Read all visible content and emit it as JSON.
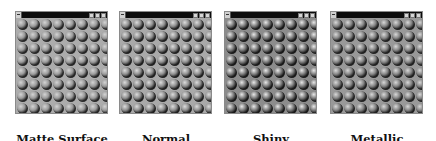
{
  "windows": [
    {
      "id": "matte",
      "label": "Matte Surface",
      "bg": "#acacac",
      "sphere_light": "#d4d4d4",
      "sphere_mid": "#9a9a9a",
      "sphere_shadow": "#1a1a1a",
      "left": 15
    },
    {
      "id": "normal",
      "label": "Normal",
      "bg": "#a9a9a9",
      "sphere_light": "#dcdcdc",
      "sphere_mid": "#8e8e8e",
      "sphere_shadow": "#141414",
      "left": 119
    },
    {
      "id": "shiny",
      "label": "Shiny",
      "bg": "#8c8c8c",
      "sphere_light": "#e8e8e8",
      "sphere_mid": "#7a7a7a",
      "sphere_shadow": "#101010",
      "left": 224
    },
    {
      "id": "metallic",
      "label": "Metallic",
      "bg": "#999999",
      "sphere_light": "#d8d8d8",
      "sphere_mid": "#858585",
      "sphere_shadow": "#161616",
      "left": 330
    }
  ],
  "grid": {
    "rows": 8,
    "cols": 8,
    "cell": 12
  },
  "titlebar": {
    "buttons": [
      "minimize",
      "maximize",
      "close"
    ],
    "color": "#0c0c0c"
  }
}
